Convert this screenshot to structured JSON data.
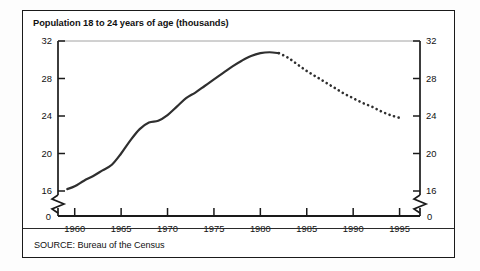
{
  "chart_data": {
    "type": "line",
    "title": "Population 18 to 24 years of age (thousands)",
    "source": "SOURCE: Bureau of the Census",
    "xlabel": "",
    "ylabel": "",
    "xlim": [
      1958,
      1997
    ],
    "ylim": [
      15,
      32
    ],
    "ylim_display": [
      0,
      32
    ],
    "axis_break": true,
    "axis_break_between": [
      0,
      16
    ],
    "grid": false,
    "legend": "none",
    "dual_y_axis": true,
    "xticks": [
      "1960",
      "1965",
      "1970",
      "1975",
      "1980",
      "1985",
      "1990",
      "1995"
    ],
    "xtick_values": [
      1960,
      1965,
      1970,
      1975,
      1980,
      1985,
      1990,
      1995
    ],
    "yticks_left": [
      "32",
      "28",
      "24",
      "20",
      "16",
      "0"
    ],
    "yticks_right": [
      "32",
      "28",
      "24",
      "20",
      "16",
      "0"
    ],
    "ytick_values": [
      32,
      28,
      24,
      20,
      16,
      0
    ],
    "series": [
      {
        "name": "Actual",
        "style": "solid",
        "x": [
          1959.2,
          1960,
          1961,
          1962,
          1963,
          1964,
          1965,
          1966,
          1967,
          1968,
          1969,
          1970,
          1971,
          1972,
          1973,
          1974,
          1975,
          1976,
          1977,
          1978,
          1979,
          1980,
          1981,
          1982
        ],
        "values": [
          16.2,
          16.5,
          17.1,
          17.6,
          18.2,
          18.8,
          20.0,
          21.4,
          22.6,
          23.3,
          23.5,
          24.1,
          25.0,
          25.9,
          26.5,
          27.2,
          27.9,
          28.6,
          29.3,
          29.9,
          30.4,
          30.7,
          30.8,
          30.7
        ]
      },
      {
        "name": "Projected",
        "style": "dotted",
        "x": [
          1982,
          1983,
          1984,
          1985,
          1986,
          1987,
          1988,
          1989,
          1990,
          1991,
          1992,
          1993,
          1994,
          1995
        ],
        "values": [
          30.7,
          30.2,
          29.5,
          28.8,
          28.2,
          27.6,
          27.0,
          26.4,
          25.9,
          25.4,
          25.0,
          24.5,
          24.1,
          23.8
        ]
      }
    ]
  },
  "icons": {
    "axis_break_left": "axis-break-zigzag",
    "axis_break_right": "axis-break-zigzag"
  }
}
